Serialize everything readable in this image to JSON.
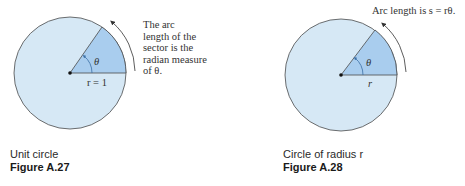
{
  "colors": {
    "circle_fill": "#d6e8f5",
    "sector_fill": "#a9cdee",
    "stroke": "#4a4a4a"
  },
  "figures": [
    {
      "note_lines": [
        "The arc",
        "length of the",
        "sector is the",
        "radian measure",
        "of θ."
      ],
      "angle_label": "θ",
      "radius_label": "r = 1",
      "caption": "Unit circle",
      "figure_label": "Figure A.27"
    },
    {
      "note": "Arc length is s = rθ.",
      "angle_label": "θ",
      "radius_label": "r",
      "caption": "Circle of radius r",
      "figure_label": "Figure A.28"
    }
  ]
}
